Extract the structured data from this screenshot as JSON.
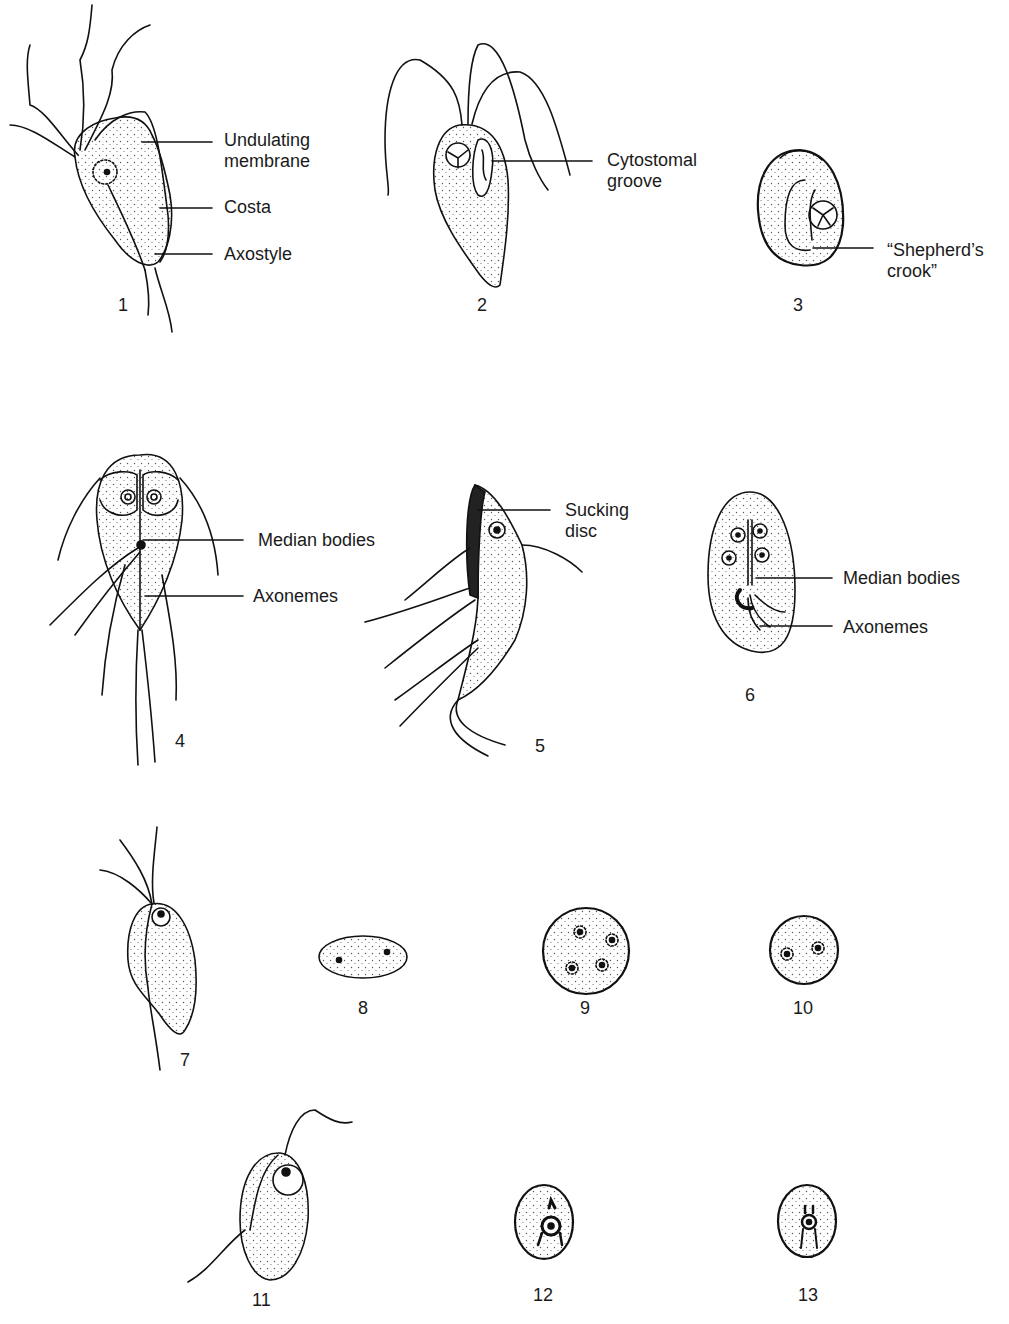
{
  "figure": {
    "panels": [
      {
        "id": "1",
        "number": "1",
        "labels": [
          "Undulating\nmembrane",
          "Costa",
          "Axostyle"
        ]
      },
      {
        "id": "2",
        "number": "2",
        "labels": [
          "Cytostomal\ngroove"
        ]
      },
      {
        "id": "3",
        "number": "3",
        "labels": [
          "“Shepherd’s\ncrook”"
        ]
      },
      {
        "id": "4",
        "number": "4",
        "labels": [
          "Median bodies",
          "Axonemes"
        ]
      },
      {
        "id": "5",
        "number": "5",
        "labels": [
          "Sucking\ndisc"
        ]
      },
      {
        "id": "6",
        "number": "6",
        "labels": [
          "Median bodies",
          "Axonemes"
        ]
      },
      {
        "id": "7",
        "number": "7",
        "labels": []
      },
      {
        "id": "8",
        "number": "8",
        "labels": []
      },
      {
        "id": "9",
        "number": "9",
        "labels": []
      },
      {
        "id": "10",
        "number": "10",
        "labels": []
      },
      {
        "id": "11",
        "number": "11",
        "labels": []
      },
      {
        "id": "12",
        "number": "12",
        "labels": []
      },
      {
        "id": "13",
        "number": "13",
        "labels": []
      }
    ]
  }
}
